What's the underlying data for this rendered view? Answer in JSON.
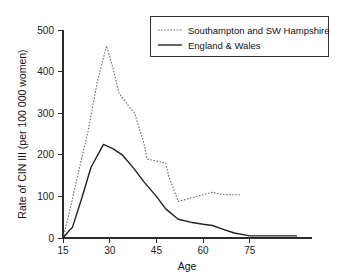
{
  "chart_data": {
    "type": "line",
    "title": "",
    "xlabel": "Age",
    "ylabel": "Rate of CIN III (per 100 000 women)",
    "xlim": [
      12,
      92
    ],
    "ylim": [
      0,
      500
    ],
    "xticks": [
      15,
      30,
      45,
      60,
      75
    ],
    "yticks": [
      0,
      100,
      200,
      300,
      400,
      500
    ],
    "xtick_labels": [
      "15",
      "30",
      "45",
      "60",
      "75"
    ],
    "ytick_labels": [
      "0",
      "100",
      "200",
      "300",
      "400",
      "500"
    ],
    "grid": false,
    "legend_position": "top-right",
    "series": [
      {
        "name": "Southampton and SW Hampshire",
        "style": "dotted",
        "color": "#6d6d6d",
        "x": [
          15,
          17,
          20,
          23,
          26,
          29,
          31,
          33,
          36,
          38,
          41,
          42,
          45,
          48,
          49,
          52,
          56,
          60,
          63,
          66,
          69,
          72
        ],
        "y": [
          0,
          60,
          160,
          255,
          375,
          462,
          410,
          348,
          318,
          300,
          228,
          190,
          185,
          180,
          148,
          88,
          96,
          104,
          110,
          105,
          104,
          104
        ]
      },
      {
        "name": "England & Wales",
        "style": "solid",
        "color": "#222222",
        "x": [
          15,
          17,
          18,
          21,
          24,
          28,
          31,
          34,
          38,
          41,
          45,
          48,
          52,
          56,
          60,
          63,
          66,
          70,
          75,
          80,
          85,
          90
        ],
        "y": [
          0,
          18,
          25,
          95,
          170,
          225,
          215,
          200,
          165,
          135,
          100,
          70,
          45,
          38,
          33,
          30,
          22,
          12,
          5,
          5,
          5,
          5
        ]
      }
    ]
  },
  "legend": {
    "entries": [
      {
        "label": "Southampton and SW Hampshire",
        "style": "dotted"
      },
      {
        "label": "England & Wales",
        "style": "solid"
      }
    ]
  },
  "axes": {
    "x_title": "Age",
    "y_title": "Rate of CIN III (per 100 000 women)"
  }
}
